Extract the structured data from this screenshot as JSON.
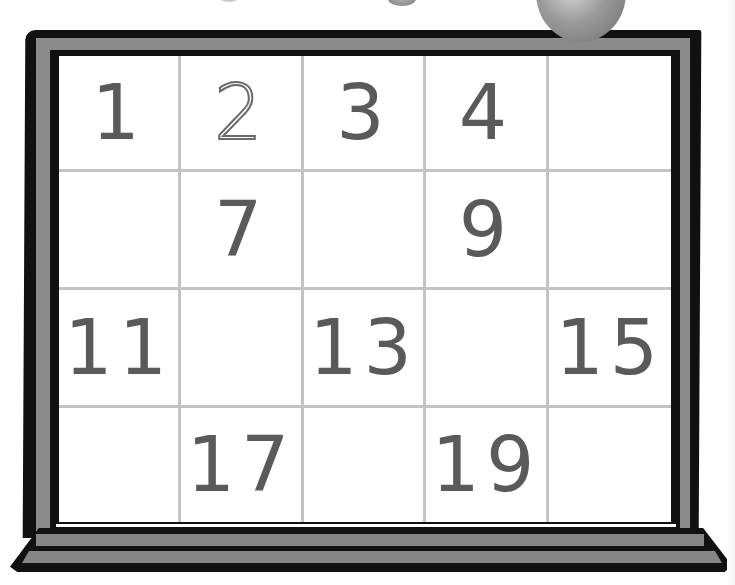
{
  "worksheet": {
    "type": "number-grid",
    "columns": 5,
    "rows": 4,
    "cells": [
      {
        "value": "1",
        "style": "solid"
      },
      {
        "value": "2",
        "style": "outline"
      },
      {
        "value": "3",
        "style": "solid"
      },
      {
        "value": "4",
        "style": "solid"
      },
      {
        "value": "",
        "style": "blank"
      },
      {
        "value": "",
        "style": "blank"
      },
      {
        "value": "7",
        "style": "solid"
      },
      {
        "value": "",
        "style": "blank"
      },
      {
        "value": "9",
        "style": "solid"
      },
      {
        "value": "",
        "style": "blank"
      },
      {
        "value": "11",
        "style": "solid"
      },
      {
        "value": "",
        "style": "blank"
      },
      {
        "value": "13",
        "style": "solid"
      },
      {
        "value": "",
        "style": "blank"
      },
      {
        "value": "15",
        "style": "solid"
      },
      {
        "value": "",
        "style": "blank"
      },
      {
        "value": "17",
        "style": "solid"
      },
      {
        "value": "",
        "style": "blank"
      },
      {
        "value": "19",
        "style": "solid"
      },
      {
        "value": "",
        "style": "blank"
      }
    ]
  },
  "colors": {
    "frame_dark": "#111111",
    "frame_gray": "#8b8b8b",
    "grid_line": "#c3c3c3",
    "numeral": "#5a5a5a",
    "board": "#ffffff"
  },
  "decorations": [
    "apple-icon",
    "seed-icon"
  ]
}
